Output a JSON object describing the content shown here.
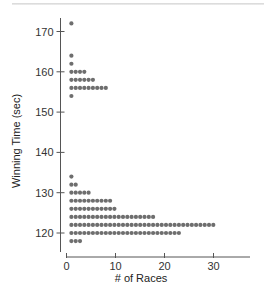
{
  "chart_data": {
    "type": "scatter",
    "subtype": "dot-plot",
    "title": "",
    "xlabel": "# of Races",
    "ylabel": "Winning Time (sec)",
    "xlim": [
      0,
      35
    ],
    "ylim": [
      116,
      174
    ],
    "xticks": [
      0,
      10,
      20,
      30
    ],
    "yticks": [
      120,
      130,
      140,
      150,
      160,
      170
    ],
    "grid": false,
    "legend": null,
    "dot_color": "#6e6e6e",
    "rows": [
      {
        "y": 172,
        "count": 1
      },
      {
        "y": 164,
        "count": 1
      },
      {
        "y": 162,
        "count": 1
      },
      {
        "y": 160,
        "count": 4
      },
      {
        "y": 158,
        "count": 6
      },
      {
        "y": 156,
        "count": 9
      },
      {
        "y": 154,
        "count": 1
      },
      {
        "y": 134,
        "count": 1
      },
      {
        "y": 132,
        "count": 2
      },
      {
        "y": 130,
        "count": 5
      },
      {
        "y": 128,
        "count": 10
      },
      {
        "y": 126,
        "count": 11
      },
      {
        "y": 124,
        "count": 20
      },
      {
        "y": 122,
        "count": 34
      },
      {
        "y": 120,
        "count": 26
      },
      {
        "y": 118,
        "count": 3
      }
    ]
  },
  "axes": {
    "x_title": "# of Races",
    "y_title": "Winning Time (sec)",
    "x_tick_labels": [
      "0",
      "10",
      "20",
      "30"
    ],
    "y_tick_labels": [
      "170",
      "160",
      "150",
      "140",
      "130",
      "120"
    ]
  }
}
